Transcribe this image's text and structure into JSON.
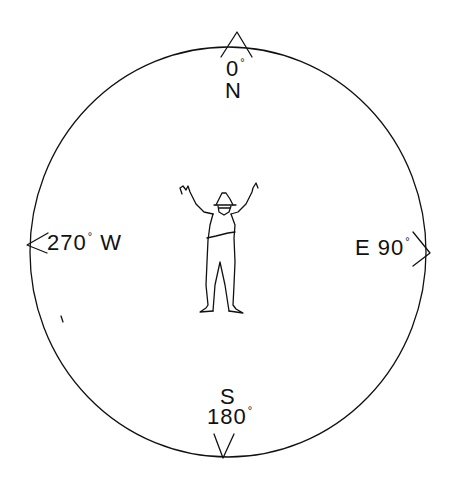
{
  "diagram": {
    "stroke_color": "#111111",
    "background": "#ffffff",
    "circle": {
      "cx": 228,
      "cy": 252,
      "rx": 198,
      "ry": 205
    },
    "directions": {
      "north": {
        "letter": "N",
        "degrees": "0",
        "deg_symbol": "°"
      },
      "east": {
        "letter": "E",
        "degrees": "90",
        "deg_symbol": "°"
      },
      "south": {
        "letter": "S",
        "degrees": "180",
        "deg_symbol": "°"
      },
      "west": {
        "letter": "W",
        "degrees": "270",
        "deg_symbol": "°"
      }
    },
    "center_figure": "person-with-arms-raised"
  }
}
